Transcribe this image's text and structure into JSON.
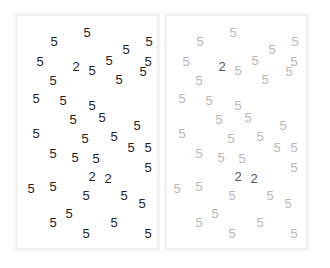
{
  "panels": [
    {
      "name": "panel-left",
      "style": "all-dark"
    },
    {
      "name": "panel-right",
      "style": "targets-highlighted"
    }
  ],
  "colors": {
    "digit_dark": "#222222",
    "distractor_light": "#b8b8b8",
    "target_right": "#555555",
    "frame": "#f3f3f3"
  },
  "digits": [
    {
      "v": "5",
      "x": 87,
      "y": 32
    },
    {
      "v": "5",
      "x": 54,
      "y": 41
    },
    {
      "v": "5",
      "x": 149,
      "y": 41
    },
    {
      "v": "5",
      "x": 126,
      "y": 49
    },
    {
      "v": "5",
      "x": 40,
      "y": 61
    },
    {
      "v": "5",
      "x": 109,
      "y": 60
    },
    {
      "v": "5",
      "x": 148,
      "y": 61
    },
    {
      "v": "2",
      "x": 76,
      "y": 66
    },
    {
      "v": "5",
      "x": 92,
      "y": 70
    },
    {
      "v": "5",
      "x": 143,
      "y": 71
    },
    {
      "v": "5",
      "x": 53,
      "y": 80
    },
    {
      "v": "5",
      "x": 119,
      "y": 79
    },
    {
      "v": "5",
      "x": 36,
      "y": 98
    },
    {
      "v": "5",
      "x": 63,
      "y": 100
    },
    {
      "v": "5",
      "x": 92,
      "y": 105
    },
    {
      "v": "5",
      "x": 102,
      "y": 117
    },
    {
      "v": "5",
      "x": 73,
      "y": 119
    },
    {
      "v": "5",
      "x": 137,
      "y": 125
    },
    {
      "v": "5",
      "x": 36,
      "y": 133
    },
    {
      "v": "5",
      "x": 114,
      "y": 136
    },
    {
      "v": "5",
      "x": 85,
      "y": 138
    },
    {
      "v": "5",
      "x": 131,
      "y": 147
    },
    {
      "v": "5",
      "x": 148,
      "y": 147
    },
    {
      "v": "5",
      "x": 53,
      "y": 153
    },
    {
      "v": "5",
      "x": 75,
      "y": 157
    },
    {
      "v": "5",
      "x": 96,
      "y": 158
    },
    {
      "v": "5",
      "x": 148,
      "y": 167
    },
    {
      "v": "2",
      "x": 92,
      "y": 176
    },
    {
      "v": "2",
      "x": 108,
      "y": 178
    },
    {
      "v": "5",
      "x": 53,
      "y": 186
    },
    {
      "v": "5",
      "x": 31,
      "y": 188
    },
    {
      "v": "5",
      "x": 86,
      "y": 195
    },
    {
      "v": "5",
      "x": 124,
      "y": 195
    },
    {
      "v": "5",
      "x": 142,
      "y": 203
    },
    {
      "v": "5",
      "x": 69,
      "y": 213
    },
    {
      "v": "5",
      "x": 53,
      "y": 222
    },
    {
      "v": "5",
      "x": 114,
      "y": 222
    },
    {
      "v": "5",
      "x": 86,
      "y": 233
    },
    {
      "v": "5",
      "x": 148,
      "y": 233
    }
  ],
  "right_offset_x": 146
}
